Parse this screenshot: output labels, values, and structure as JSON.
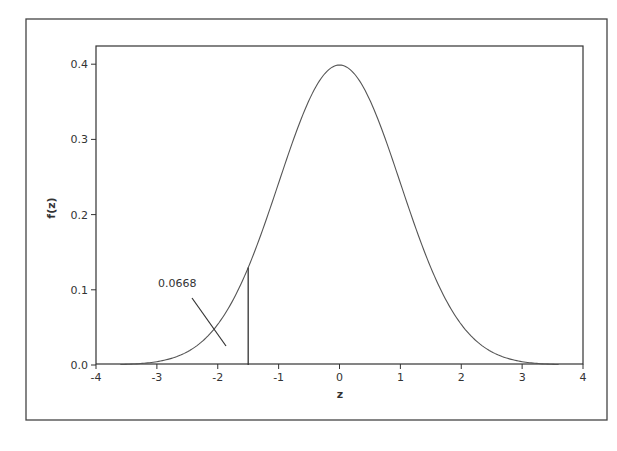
{
  "chart_data": {
    "type": "line",
    "title": "",
    "xlabel": "z",
    "ylabel": "f(z)",
    "xlim": [
      -4,
      4
    ],
    "ylim": [
      0.0,
      0.42
    ],
    "xticks": [
      -4,
      -3,
      -2,
      -1,
      0,
      1,
      2,
      3,
      4
    ],
    "xtick_labels": [
      "-4",
      "-3",
      "-2",
      "-1",
      "0",
      "1",
      "2",
      "3",
      "4"
    ],
    "yticks": [
      0.0,
      0.1,
      0.2,
      0.3,
      0.4
    ],
    "ytick_labels": [
      "0.0",
      "0.1",
      "0.2",
      "0.3",
      "0.4"
    ],
    "grid": false,
    "legend": null,
    "series": [
      {
        "name": "Standard normal density",
        "x": [
          -3.6,
          -3.5,
          -3.0,
          -2.5,
          -2.0,
          -1.5,
          -1.0,
          -0.5,
          0.0,
          0.5,
          1.0,
          1.5,
          2.0,
          2.5,
          3.0,
          3.5,
          3.6
        ],
        "values": [
          0.0006,
          0.0009,
          0.0044,
          0.0175,
          0.054,
          0.1295,
          0.242,
          0.3521,
          0.3989,
          0.3521,
          0.242,
          0.1295,
          0.054,
          0.0175,
          0.0044,
          0.0009,
          0.0006
        ]
      }
    ],
    "annotations": [
      {
        "type": "vline",
        "x": -1.5,
        "y_from": 0.0,
        "y_to": 0.1295
      },
      {
        "type": "label",
        "text": "0.0668",
        "x": -2.2,
        "y": 0.105,
        "note": "area of left tail, with pointer line crossing the curve near z = -2"
      }
    ],
    "curve_range": [
      -3.6,
      3.6
    ]
  },
  "labels": {
    "x_axis_title": "z",
    "y_axis_title": "f(z)",
    "tail_area": "0.0668"
  },
  "colors": {
    "curve": "#555555",
    "axis": "#333333",
    "frame": "#444444",
    "background": "#ffffff"
  }
}
